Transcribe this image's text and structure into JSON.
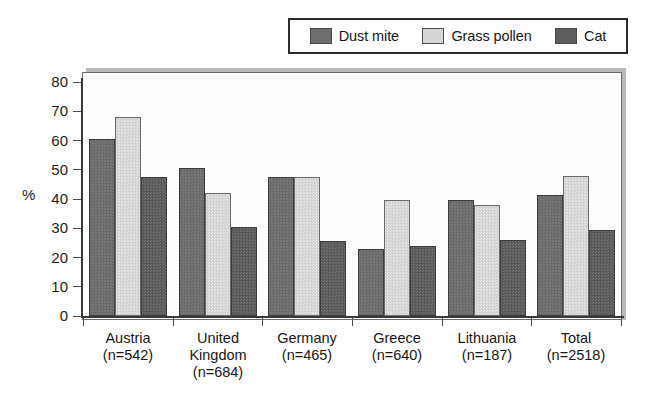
{
  "chart_data": {
    "type": "bar",
    "title": "",
    "xlabel": "",
    "ylabel": "%",
    "ylim": [
      0,
      80
    ],
    "yticks": [
      0,
      10,
      20,
      30,
      40,
      50,
      60,
      70,
      80
    ],
    "grid": false,
    "legend_position": "top",
    "categories": [
      "Austria",
      "United Kingdom",
      "Germany",
      "Greece",
      "Lithuania",
      "Total"
    ],
    "category_lines": [
      [
        "Austria",
        "(n=542)"
      ],
      [
        "United",
        "Kingdom",
        "(n=684)"
      ],
      [
        "Germany",
        "(n=465)"
      ],
      [
        "Greece",
        "(n=640)"
      ],
      [
        "Lithuania",
        "(n=187)"
      ],
      [
        "Total",
        "(n=2518)"
      ]
    ],
    "sample_sizes": [
      542,
      684,
      465,
      640,
      187,
      2518
    ],
    "series": [
      {
        "name": "Dust mite",
        "color": "#6e6e6e",
        "values": [
          60.5,
          50.5,
          47.5,
          23.0,
          39.5,
          41.5
        ]
      },
      {
        "name": "Grass pollen",
        "color": "#d6d6d6",
        "values": [
          68.0,
          42.0,
          47.5,
          39.5,
          38.0,
          48.0
        ]
      },
      {
        "name": "Cat",
        "color": "#5d5d5d",
        "values": [
          47.5,
          30.5,
          25.5,
          24.0,
          26.0,
          29.5
        ]
      }
    ]
  },
  "legend": {
    "items": [
      {
        "label": "Dust mite",
        "color": "#6e6e6e"
      },
      {
        "label": "Grass pollen",
        "color": "#d6d6d6"
      },
      {
        "label": "Cat",
        "color": "#5d5d5d"
      }
    ]
  },
  "axis": {
    "y_title": "%",
    "y_tick_labels": [
      "80",
      "70",
      "60",
      "50",
      "40",
      "30",
      "20",
      "10",
      "0"
    ]
  }
}
